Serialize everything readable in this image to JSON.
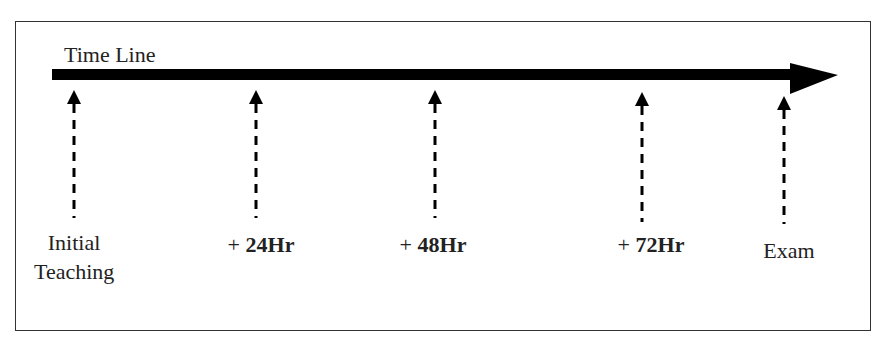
{
  "diagram": {
    "title": "Time Line",
    "markers": [
      {
        "id": "initial",
        "line1": "Initial",
        "line2": "Teaching",
        "x": 74
      },
      {
        "id": "24",
        "prefix": "+ ",
        "label": "24Hr",
        "x": 256
      },
      {
        "id": "48",
        "prefix": "+ ",
        "label": "48Hr",
        "x": 435
      },
      {
        "id": "72",
        "prefix": "+ ",
        "label": "72Hr",
        "x": 642
      },
      {
        "id": "exam",
        "line1": "Exam",
        "x": 784
      }
    ],
    "colors": {
      "line": "#000000",
      "border": "#333333",
      "text": "#222222"
    }
  }
}
